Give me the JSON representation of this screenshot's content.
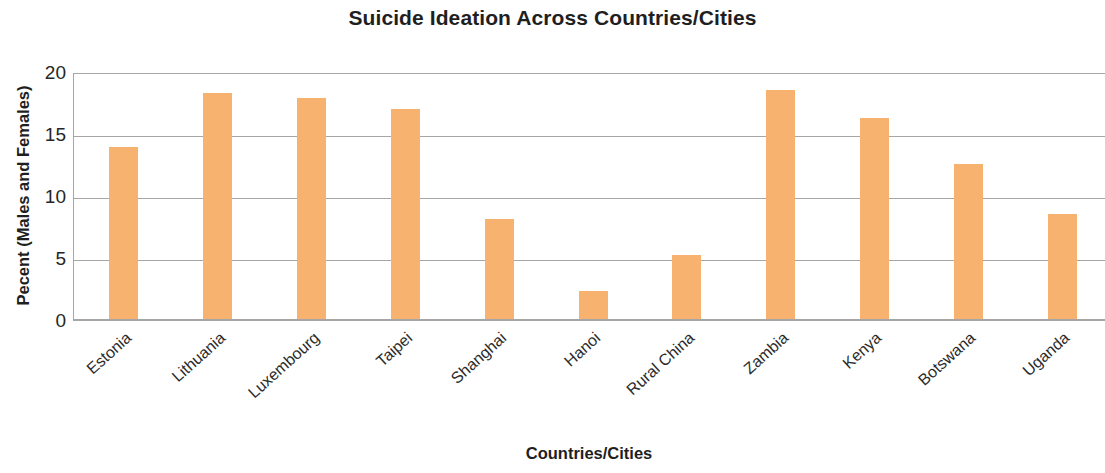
{
  "chart_data": {
    "type": "bar",
    "title": "Suicide Ideation Across Countries/Cities",
    "xlabel": "Countries/Cities",
    "ylabel": "Pecent (Males and Females)",
    "categories": [
      "Estonia",
      "Lithuania",
      "Luxembourg",
      "Taipei",
      "Shanghai",
      "Hanoi",
      "Rural China",
      "Zambia",
      "Kenya",
      "Botswana",
      "Uganda"
    ],
    "values": [
      14.0,
      18.4,
      18.0,
      17.1,
      8.2,
      2.4,
      5.3,
      18.6,
      16.4,
      12.7,
      8.6
    ],
    "ylim": [
      0,
      20
    ],
    "yticks": [
      "0",
      "5",
      "10",
      "15",
      "20"
    ],
    "ytick_values": [
      0,
      5,
      10,
      15,
      20
    ],
    "grid": "horizontal",
    "legend": "none",
    "bar_color": "#f8b270",
    "grid_color": "#a6a6a6",
    "text_color": "#1f1f1f"
  }
}
